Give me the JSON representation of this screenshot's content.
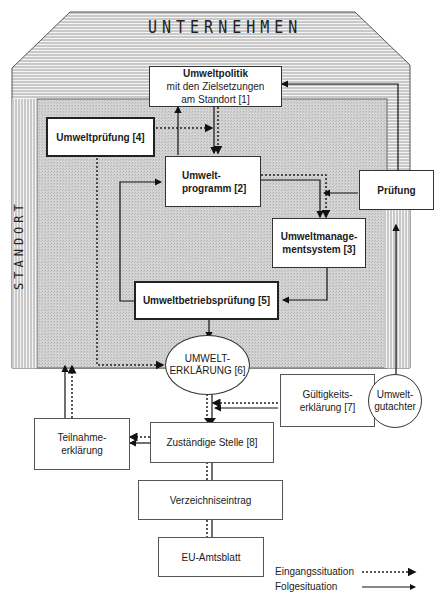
{
  "labels": {
    "unternehmen": "UNTERNEHMEN",
    "standort": "STANDORT"
  },
  "nodes": {
    "umweltpolitik": [
      "Umweltpolitik",
      "mit den Zielsetzungen",
      "am Standort [1]"
    ],
    "umweltpruefung": "Umweltprüfung [4]",
    "umweltprogramm": [
      "Umwelt-",
      "programm [2]"
    ],
    "pruefung": "Prüfung",
    "umweltmanagementsystem": [
      "Umweltmanage-",
      "mentsystem [3]"
    ],
    "umweltbetriebspruefung": "Umweltbetriebsprüfung [5]",
    "umwelterklaerung": [
      "UMWELT-",
      "ERKLÄRUNG [6]"
    ],
    "gueltigkeitserklaerung": [
      "Gültigkeits-",
      "erklärung [7]"
    ],
    "umweltgutachter": [
      "Umwelt-",
      "gutachter"
    ],
    "teilnahmeerklaerung": [
      "Teilnahme-",
      "erklärung"
    ],
    "zustaendige_stelle": "Zuständige Stelle [8]",
    "verzeichniseintrag": "Verzeichniseintrag",
    "eu_amtsblatt": "EU-Amtsblatt"
  },
  "legend": {
    "eingang": "Eingangssituation",
    "folge": "Folgesituation"
  }
}
